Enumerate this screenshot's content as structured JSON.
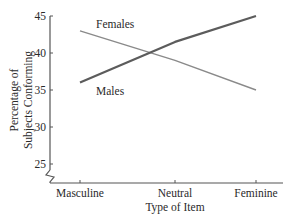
{
  "chart_data": {
    "type": "line",
    "title": "",
    "xlabel": "Type of Item",
    "ylabel": "Percentage of Subjects Conforming",
    "ylabel_lines": [
      "Percentage of",
      "Subjects Conforming"
    ],
    "categories": [
      "Masculine",
      "Neutral",
      "Feminine"
    ],
    "ylim": [
      25,
      45
    ],
    "yticks": [
      25,
      30,
      35,
      40,
      45
    ],
    "axis_break": true,
    "grid": false,
    "legend": "inline labels",
    "series": [
      {
        "name": "Females",
        "values": [
          43,
          39,
          35
        ],
        "color": "#8a8a8a",
        "stroke_width": 1.4
      },
      {
        "name": "Males",
        "values": [
          36,
          41.5,
          45
        ],
        "color": "#5c5c5c",
        "stroke_width": 2.2
      }
    ],
    "annotations": [
      {
        "text": "Females",
        "near": "Females line, left"
      },
      {
        "text": "Males",
        "near": "Males line, left"
      }
    ]
  },
  "layout": {
    "axis_x": 50,
    "axis_top": 16,
    "baseline_y": 183,
    "y_at_45": 16,
    "px_per_unit": 7.4,
    "cat_x": [
      80,
      175,
      256
    ]
  }
}
